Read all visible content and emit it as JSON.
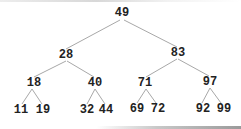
{
  "diagram": {
    "type": "binary-search-tree",
    "edge_color": "#a8a8a8",
    "text_color": "#222222",
    "nodes": [
      {
        "id": "n49",
        "label": "49",
        "x": 122,
        "y": 13
      },
      {
        "id": "n28",
        "label": "28",
        "x": 66,
        "y": 55
      },
      {
        "id": "n83",
        "label": "83",
        "x": 178,
        "y": 53
      },
      {
        "id": "n18",
        "label": "18",
        "x": 34,
        "y": 83
      },
      {
        "id": "n40",
        "label": "40",
        "x": 95,
        "y": 83
      },
      {
        "id": "n71",
        "label": "71",
        "x": 145,
        "y": 83
      },
      {
        "id": "n97",
        "label": "97",
        "x": 210,
        "y": 82
      },
      {
        "id": "n11",
        "label": "11",
        "x": 21,
        "y": 110
      },
      {
        "id": "n19",
        "label": "19",
        "x": 43,
        "y": 110
      },
      {
        "id": "n32",
        "label": "32",
        "x": 87,
        "y": 110
      },
      {
        "id": "n44",
        "label": "44",
        "x": 106,
        "y": 110
      },
      {
        "id": "n69",
        "label": "69",
        "x": 137,
        "y": 109
      },
      {
        "id": "n72",
        "label": "72",
        "x": 158,
        "y": 109
      },
      {
        "id": "n92",
        "label": "92",
        "x": 203,
        "y": 109
      },
      {
        "id": "n99",
        "label": "99",
        "x": 224,
        "y": 109
      }
    ],
    "edges": [
      {
        "from": "n49",
        "to": "n28",
        "x1": 120,
        "y1": 20,
        "x2": 66,
        "y2": 49
      },
      {
        "from": "n49",
        "to": "n83",
        "x1": 124,
        "y1": 20,
        "x2": 177,
        "y2": 47
      },
      {
        "from": "n28",
        "to": "n18",
        "x1": 66,
        "y1": 61,
        "x2": 34,
        "y2": 77
      },
      {
        "from": "n28",
        "to": "n40",
        "x1": 67,
        "y1": 61,
        "x2": 94,
        "y2": 77
      },
      {
        "from": "n83",
        "to": "n71",
        "x1": 177,
        "y1": 59,
        "x2": 146,
        "y2": 77
      },
      {
        "from": "n83",
        "to": "n97",
        "x1": 178,
        "y1": 59,
        "x2": 209,
        "y2": 76
      },
      {
        "from": "n18",
        "to": "n11",
        "x1": 32,
        "y1": 89,
        "x2": 22,
        "y2": 104
      },
      {
        "from": "n18",
        "to": "n19",
        "x1": 32,
        "y1": 89,
        "x2": 42,
        "y2": 104
      },
      {
        "from": "n40",
        "to": "n32",
        "x1": 95,
        "y1": 89,
        "x2": 87,
        "y2": 104
      },
      {
        "from": "n40",
        "to": "n44",
        "x1": 95,
        "y1": 89,
        "x2": 105,
        "y2": 104
      },
      {
        "from": "n71",
        "to": "n69",
        "x1": 146,
        "y1": 89,
        "x2": 137,
        "y2": 103
      },
      {
        "from": "n71",
        "to": "n72",
        "x1": 146,
        "y1": 89,
        "x2": 156,
        "y2": 103
      },
      {
        "from": "n97",
        "to": "n92",
        "x1": 210,
        "y1": 88,
        "x2": 202,
        "y2": 103
      },
      {
        "from": "n97",
        "to": "n99",
        "x1": 210,
        "y1": 88,
        "x2": 221,
        "y2": 103
      }
    ]
  }
}
